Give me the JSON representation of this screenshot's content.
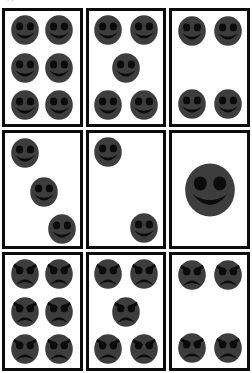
{
  "page": {
    "top_text_sliver": "clipped line of text",
    "background_color": "#ffffff",
    "card_border_color": "#0b0b0b",
    "face_fill_color": "#3d3d3d",
    "feature_color": "#0b0b0b"
  },
  "grid": {
    "rows": 3,
    "columns": 3
  },
  "cards": [
    {
      "id": "card-1",
      "position": "row-1-col-1",
      "mood": "happy",
      "count": 6,
      "arrangement": "2x3-grid",
      "face_radius": 15,
      "faces": [
        {
          "x": 27,
          "y": 17
        },
        {
          "x": 73,
          "y": 17
        },
        {
          "x": 27,
          "y": 50
        },
        {
          "x": 73,
          "y": 50
        },
        {
          "x": 27,
          "y": 83
        },
        {
          "x": 73,
          "y": 83
        }
      ]
    },
    {
      "id": "card-2",
      "position": "row-1-col-2",
      "mood": "happy",
      "count": 5,
      "arrangement": "quincunx",
      "face_radius": 15,
      "faces": [
        {
          "x": 26,
          "y": 17
        },
        {
          "x": 74,
          "y": 17
        },
        {
          "x": 50,
          "y": 50
        },
        {
          "x": 26,
          "y": 83
        },
        {
          "x": 74,
          "y": 83
        }
      ]
    },
    {
      "id": "card-3",
      "position": "row-1-col-3",
      "mood": "happy",
      "count": 4,
      "arrangement": "four-corners",
      "face_radius": 15,
      "faces": [
        {
          "x": 27,
          "y": 18
        },
        {
          "x": 74,
          "y": 18
        },
        {
          "x": 27,
          "y": 82
        },
        {
          "x": 74,
          "y": 82
        }
      ]
    },
    {
      "id": "card-4",
      "position": "row-2-col-1",
      "mood": "happy",
      "count": 3,
      "arrangement": "diagonal",
      "face_radius": 15,
      "faces": [
        {
          "x": 27,
          "y": 18
        },
        {
          "x": 52,
          "y": 52
        },
        {
          "x": 76,
          "y": 85
        }
      ]
    },
    {
      "id": "card-5",
      "position": "row-2-col-2",
      "mood": "happy",
      "count": 2,
      "arrangement": "diagonal",
      "face_radius": 15,
      "faces": [
        {
          "x": 26,
          "y": 17
        },
        {
          "x": 74,
          "y": 84
        }
      ]
    },
    {
      "id": "card-6",
      "position": "row-2-col-3",
      "mood": "happy",
      "count": 1,
      "arrangement": "single-center-large",
      "face_radius": 27,
      "faces": [
        {
          "x": 50,
          "y": 50
        }
      ]
    },
    {
      "id": "card-7",
      "position": "row-3-col-1",
      "mood": "sad",
      "count": 6,
      "arrangement": "2x3-grid",
      "face_radius": 15,
      "faces": [
        {
          "x": 27,
          "y": 17
        },
        {
          "x": 73,
          "y": 17
        },
        {
          "x": 27,
          "y": 50
        },
        {
          "x": 73,
          "y": 50
        },
        {
          "x": 27,
          "y": 83
        },
        {
          "x": 73,
          "y": 83
        }
      ]
    },
    {
      "id": "card-8",
      "position": "row-3-col-2",
      "mood": "sad",
      "count": 5,
      "arrangement": "quincunx",
      "face_radius": 15,
      "faces": [
        {
          "x": 26,
          "y": 17
        },
        {
          "x": 74,
          "y": 17
        },
        {
          "x": 50,
          "y": 50
        },
        {
          "x": 26,
          "y": 83
        },
        {
          "x": 74,
          "y": 83
        }
      ]
    },
    {
      "id": "card-9",
      "position": "row-3-col-3",
      "mood": "sad",
      "count": 4,
      "arrangement": "four-corners",
      "face_radius": 15,
      "faces": [
        {
          "x": 27,
          "y": 18
        },
        {
          "x": 74,
          "y": 18
        },
        {
          "x": 27,
          "y": 82
        },
        {
          "x": 74,
          "y": 82
        }
      ]
    }
  ]
}
